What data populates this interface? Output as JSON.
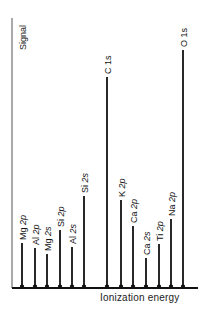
{
  "chart_data": {
    "type": "bar",
    "title": "",
    "xlabel": "Ionization energy",
    "ylabel": "Signal",
    "grid": false,
    "legend": null,
    "categories": [
      "Mg 2p",
      "Al 2p",
      "Mg 2s",
      "Si 2p",
      "Al 2s",
      "Si 2s",
      "C 1s",
      "K 2p",
      "Ca 2p",
      "Ca 2s",
      "Ti 2p",
      "Na 2p",
      "O 1s"
    ],
    "values": [
      16,
      14,
      12,
      20,
      14,
      33,
      75,
      31,
      22,
      10,
      15,
      24,
      88
    ],
    "ylim": [
      0,
      100
    ],
    "peaks": [
      {
        "label": "Mg 2p",
        "element": "Mg",
        "orbital": "2p",
        "x": 22,
        "tip": 243
      },
      {
        "label": "Al 2p",
        "element": "Al",
        "orbital": "2p",
        "x": 35,
        "tip": 248
      },
      {
        "label": "Mg 2s",
        "element": "Mg",
        "orbital": "2s",
        "x": 47,
        "tip": 254
      },
      {
        "label": "Si 2p",
        "element": "Si",
        "orbital": "2p",
        "x": 60,
        "tip": 230
      },
      {
        "label": "Al 2s",
        "element": "Al",
        "orbital": "2s",
        "x": 72,
        "tip": 247
      },
      {
        "label": "Si 2s",
        "element": "Si",
        "orbital": "2s",
        "x": 84,
        "tip": 196
      },
      {
        "label": "C 1s",
        "element": "C",
        "orbital": "1s",
        "x": 107,
        "tip": 77
      },
      {
        "label": "K 2p",
        "element": "K",
        "orbital": "2p",
        "x": 121,
        "tip": 200
      },
      {
        "label": "Ca 2p",
        "element": "Ca",
        "orbital": "2p",
        "x": 133,
        "tip": 226
      },
      {
        "label": "Ca 2s",
        "element": "Ca",
        "orbital": "2s",
        "x": 146,
        "tip": 258
      },
      {
        "label": "Ti 2p",
        "element": "Ti",
        "orbital": "2p",
        "x": 159,
        "tip": 244
      },
      {
        "label": "Na 2p",
        "element": "Na",
        "orbital": "2p",
        "x": 171,
        "tip": 219
      },
      {
        "label": "O 1s",
        "element": "O",
        "orbital": "1s",
        "x": 183,
        "tip": 50
      }
    ]
  }
}
